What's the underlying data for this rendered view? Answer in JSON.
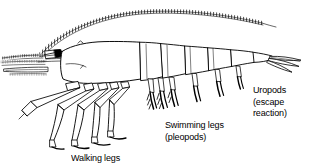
{
  "figure": {
    "kind": "scientific-line-drawing",
    "background_color": "#ffffff",
    "ink_color": "#000000"
  },
  "labels": {
    "uropods": {
      "name": "uropods-label",
      "lines": [
        "Uropods",
        "(escape",
        "reaction)"
      ]
    },
    "swimming_legs": {
      "name": "swimming-legs-label",
      "lines": [
        "Swimming legs",
        "(pleopods)"
      ]
    },
    "walking_legs": {
      "name": "walking-legs-label",
      "lines": [
        "Walking legs"
      ]
    }
  },
  "anatomy_parts": [
    "long-antenna",
    "antennules",
    "eye",
    "rostrum",
    "carapace",
    "abdominal-segments",
    "walking-legs",
    "cheliped",
    "swimming-legs-pleopods",
    "telson",
    "uropods-tail-fan"
  ]
}
